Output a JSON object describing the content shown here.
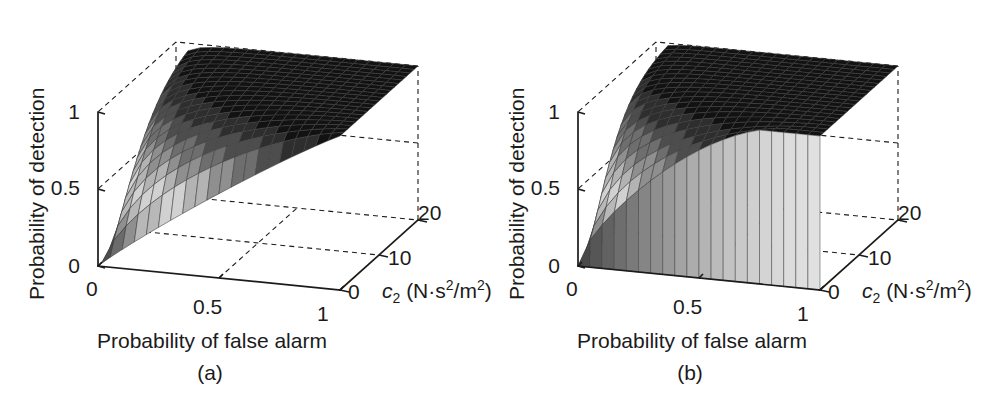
{
  "figure": {
    "width": 992,
    "height": 400,
    "background": "#ffffff",
    "ink": "#1b1b1b"
  },
  "panels": [
    {
      "id": "a",
      "caption": "(a)",
      "x_offset": 0,
      "z_axis_title": "Probability of detection",
      "x_axis_title": "Probability of false alarm",
      "y_axis_title_parts": {
        "symbol": "c",
        "subscript": "2",
        "units_open": " (N·s",
        "units_sup1": "2",
        "units_mid": "/m",
        "units_sup2": "2",
        "units_close": ")"
      },
      "y_axis_title_plain": "c2 (N·s2/m2)",
      "z_ticks": [
        "0",
        "0.5",
        "1"
      ],
      "x_ticks": [
        "0",
        "0.5",
        "1"
      ],
      "y_ticks": [
        "0",
        "10",
        "20"
      ]
    },
    {
      "id": "b",
      "caption": "(b)",
      "x_offset": 480,
      "z_axis_title": "Probability of detection",
      "x_axis_title": "Probability of false alarm",
      "y_axis_title_parts": {
        "symbol": "c",
        "subscript": "2",
        "units_open": " (N·s",
        "units_sup1": "2",
        "units_mid": "/m",
        "units_sup2": "2",
        "units_close": ")"
      },
      "y_axis_title_plain": "c2 (N·s2/m2)",
      "z_ticks": [
        "0",
        "0.5",
        "1"
      ],
      "x_ticks": [
        "0",
        "0.5",
        "1"
      ],
      "y_ticks": [
        "0",
        "10",
        "20"
      ]
    }
  ],
  "chart_data": {
    "type": "surface",
    "n_charts": 2,
    "title": "",
    "colormap": "grayscale",
    "shared": {
      "xlabel": "Probability of false alarm",
      "ylabel": "c2 (N·s2/m2)",
      "zlabel": "Probability of detection",
      "xlim": [
        0,
        1
      ],
      "ylim": [
        0,
        20
      ],
      "zlim": [
        0,
        1
      ],
      "xticks": [
        0,
        0.5,
        1
      ],
      "yticks": [
        0,
        10,
        20
      ],
      "zticks": [
        0,
        0.5,
        1
      ],
      "grid": true,
      "legend": null,
      "mesh_nx": 20,
      "mesh_ny": 20,
      "view_azimuth_deg": -37.5,
      "view_elevation_deg": 30
    },
    "charts": [
      {
        "id": "a",
        "caption": "(a)",
        "description": "ROC surface: probability of detection vs probability of false alarm and c2. Smooth concave ROC curves; detection probability increases with c2.",
        "model": "roc_smooth",
        "params": {
          "d_min": 0.12,
          "d_max": 3.3,
          "front_step": 0.0
        },
        "samples": {
          "pfa": [
            0,
            0.05,
            0.1,
            0.2,
            0.3,
            0.5,
            0.7,
            1.0
          ],
          "series": [
            {
              "c2": 0,
              "pd": [
                0.0,
                0.08,
                0.14,
                0.24,
                0.34,
                0.52,
                0.71,
                1.0
              ]
            },
            {
              "c2": 5,
              "pd": [
                0.0,
                0.3,
                0.42,
                0.56,
                0.66,
                0.8,
                0.9,
                1.0
              ]
            },
            {
              "c2": 10,
              "pd": [
                0.0,
                0.52,
                0.65,
                0.77,
                0.85,
                0.93,
                0.97,
                1.0
              ]
            },
            {
              "c2": 15,
              "pd": [
                0.0,
                0.68,
                0.79,
                0.88,
                0.93,
                0.97,
                0.99,
                1.0
              ]
            },
            {
              "c2": 20,
              "pd": [
                0.0,
                0.79,
                0.88,
                0.94,
                0.97,
                0.99,
                1.0,
                1.0
              ]
            }
          ]
        }
      },
      {
        "id": "b",
        "caption": "(b)",
        "description": "ROC surface with a discontinuous front edge: at c2 near 0 the surface rises abruptly from the floor, forming a vertical skirt along the low-c2 boundary; curves are steeper near the origin than in (a).",
        "model": "roc_stepped",
        "params": {
          "d_min": 0.35,
          "d_max": 3.8,
          "front_step": 0.3
        },
        "samples": {
          "pfa": [
            0,
            0.05,
            0.1,
            0.2,
            0.3,
            0.5,
            0.7,
            1.0
          ],
          "series": [
            {
              "c2": 0,
              "pd": [
                0.0,
                0.18,
                0.27,
                0.4,
                0.5,
                0.66,
                0.81,
                1.0
              ]
            },
            {
              "c2": 5,
              "pd": [
                0.0,
                0.46,
                0.58,
                0.7,
                0.78,
                0.88,
                0.94,
                1.0
              ]
            },
            {
              "c2": 10,
              "pd": [
                0.0,
                0.66,
                0.76,
                0.85,
                0.9,
                0.95,
                0.98,
                1.0
              ]
            },
            {
              "c2": 15,
              "pd": [
                0.0,
                0.79,
                0.87,
                0.93,
                0.96,
                0.98,
                0.99,
                1.0
              ]
            },
            {
              "c2": 20,
              "pd": [
                0.0,
                0.87,
                0.92,
                0.96,
                0.98,
                0.99,
                1.0,
                1.0
              ]
            }
          ]
        }
      }
    ]
  }
}
